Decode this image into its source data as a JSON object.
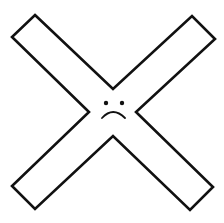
{
  "graphic": {
    "name": "sad-cross",
    "description": "Outlined X (cross) shape with a sad face at the center",
    "colors": {
      "background": "#ffffff",
      "stroke": "#111111",
      "fill": "#ffffff"
    },
    "icon": "x-mark-sad-face-icon"
  }
}
